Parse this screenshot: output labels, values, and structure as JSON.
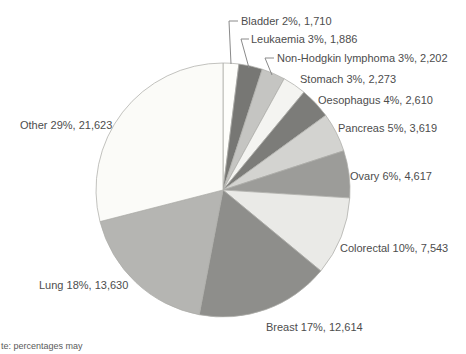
{
  "chart_data": {
    "type": "pie",
    "title": "",
    "direction": "clockwise",
    "start_angle_deg": 0,
    "legend_position": "labels-around-pie",
    "stroke_color": "#adadaa",
    "leader_line_color": "#8a8a8a",
    "label_color": "#4d4d4d",
    "slices": [
      {
        "label": "Bladder",
        "percent": 2,
        "value": 1710,
        "display": "Bladder 2%, 1,710",
        "color": "#fefefb"
      },
      {
        "label": "Leukaemia",
        "percent": 3,
        "value": 1886,
        "display": "Leukaemia 3%, 1,886",
        "color": "#777774"
      },
      {
        "label": "Non-Hodgkin lymphoma",
        "percent": 3,
        "value": 2202,
        "display": "Non-Hodgkin lymphoma 3%, 2,202",
        "color": "#c5c5c2"
      },
      {
        "label": "Stomach",
        "percent": 3,
        "value": 2273,
        "display": "Stomach 3%, 2,273",
        "color": "#f4f4f1"
      },
      {
        "label": "Oesophagus",
        "percent": 4,
        "value": 2610,
        "display": "Oesophagus 4%, 2,610",
        "color": "#7c7c79"
      },
      {
        "label": "Pancreas",
        "percent": 5,
        "value": 3619,
        "display": "Pancreas 5%, 3,619",
        "color": "#d3d3d0"
      },
      {
        "label": "Ovary",
        "percent": 6,
        "value": 4617,
        "display": "Ovary 6%, 4,617",
        "color": "#9c9c99"
      },
      {
        "label": "Colorectal",
        "percent": 10,
        "value": 7543,
        "display": "Colorectal 10%, 7,543",
        "color": "#eaeae7"
      },
      {
        "label": "Breast",
        "percent": 17,
        "value": 12614,
        "display": "Breast 17%, 12,614",
        "color": "#8e8e8b"
      },
      {
        "label": "Lung",
        "percent": 18,
        "value": 13630,
        "display": "Lung 18%, 13,630",
        "color": "#b5b5b2"
      },
      {
        "label": "Other",
        "percent": 29,
        "value": 21623,
        "display": "Other 29%, 21,623",
        "color": "#fbfbf8"
      }
    ],
    "note": "te: percentages may"
  }
}
